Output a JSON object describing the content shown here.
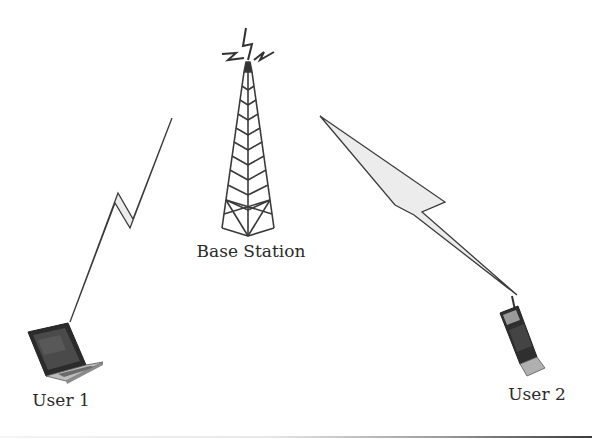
{
  "diagram": {
    "type": "wireless-network",
    "colors": {
      "background": "#ffffff",
      "stroke": "#3a3a3a",
      "bolt_fill": "#ececec",
      "device_dark": "#2b2b2b",
      "device_light": "#b8b8b8"
    },
    "nodes": [
      {
        "id": "base-station",
        "label": "Base Station",
        "icon": "radio-tower-icon"
      },
      {
        "id": "user1",
        "label": "User 1",
        "icon": "laptop-icon"
      },
      {
        "id": "user2",
        "label": "User 2",
        "icon": "mobile-phone-icon"
      }
    ],
    "links": [
      {
        "from": "user1",
        "to": "base-station",
        "style": "lightning-bolt"
      },
      {
        "from": "base-station",
        "to": "user2",
        "style": "lightning-bolt"
      }
    ]
  }
}
